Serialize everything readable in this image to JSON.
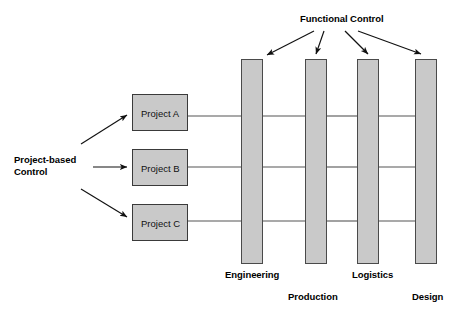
{
  "diagram": {
    "title_top": "Functional Control",
    "title_left_line1": "Project-based",
    "title_left_line2": "Control",
    "projects": [
      {
        "label": "Project A",
        "x": 132,
        "y": 94,
        "w": 56,
        "h": 37,
        "row_y": 116
      },
      {
        "label": "Project B",
        "x": 132,
        "y": 149,
        "w": 56,
        "h": 37,
        "row_y": 167
      },
      {
        "label": "Project C",
        "x": 132,
        "y": 204,
        "w": 56,
        "h": 37,
        "row_y": 221
      }
    ],
    "functions": [
      {
        "label": "Engineering",
        "x": 241,
        "y": 59,
        "w": 22,
        "h": 205,
        "label_x": 225,
        "label_y": 269
      },
      {
        "label": "Production",
        "x": 305,
        "y": 59,
        "w": 22,
        "h": 205,
        "label_x": 287,
        "label_y": 291
      },
      {
        "label": "Logistics",
        "x": 357,
        "y": 59,
        "w": 22,
        "h": 205,
        "label_x": 352,
        "label_y": 269
      },
      {
        "label": "Design",
        "x": 415,
        "y": 59,
        "w": 22,
        "h": 205,
        "label_x": 411,
        "label_y": 291
      }
    ],
    "colors": {
      "box_fill": "#c9c9c9",
      "box_border": "#3a3a3a",
      "column_fill": "#c9c9c9",
      "column_border": "#4a4a4a",
      "line": "#555555",
      "arrow": "#111111",
      "text": "#000000",
      "background": "#ffffff"
    },
    "connector_rows": [
      116,
      167,
      221
    ],
    "functional_arrow_origin": {
      "x": 330,
      "y": 24
    },
    "project_arrow_origin": {
      "x": 93,
      "y": 167
    }
  }
}
